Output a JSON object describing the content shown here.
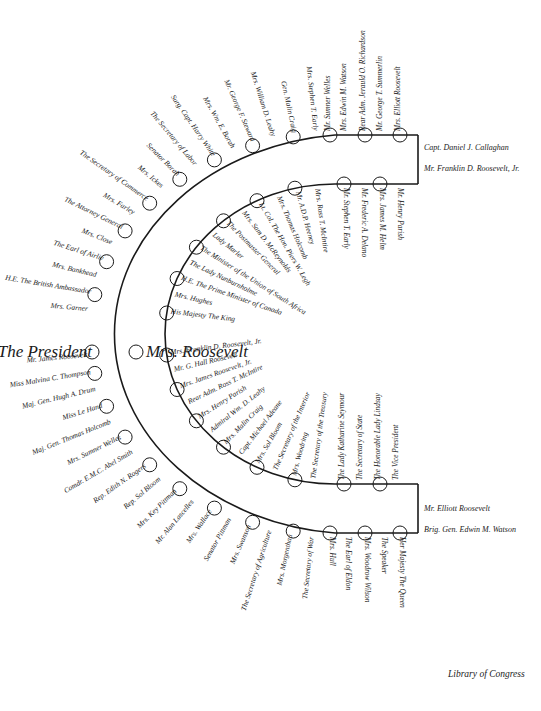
{
  "credit": "Library of Congress",
  "outer_top_leg": [
    "Mrs. Elliott Roosevelt",
    "Mr. George T. Summerlin",
    "Rear Adm. Jerauld O. Richardson",
    "Mrs. Edwin M. Watson",
    "Mr. Sumner Welles",
    "Mrs. Stephen T. Early",
    "Gen. Malin Craig",
    "Mrs. William D. Leahy",
    "Mr. George F. Steward",
    "Mrs. Wm. E. Borah",
    "Surg. Capt. Harry White",
    "The Secretary of Labor",
    "Senator Borah",
    "Mrs. Ickes",
    "The Secretary of Commerce",
    "Mrs. Farley",
    "The Attorney General",
    "Mrs. Close",
    "The Earl of Airlie",
    "Mrs. Bankhead",
    "H.E. The British Ambassador",
    "Mrs. Garner"
  ],
  "outer_center": {
    "left": "The President",
    "right": "Mrs. Roosevelt"
  },
  "outer_bottom_leg": [
    "Her Majesty The Queen",
    "The Speaker",
    "Mrs. Woodrow Wilson",
    "The Earl of Eldon",
    "Mrs. Hull",
    "The Secretary of War",
    "Mrs. Morgenthau",
    "The Secretary of Agriculture",
    "Mrs. Swanson",
    "Senator Pittman",
    "Mrs. Wallace",
    "Mr. Alan Lascelles",
    "Mrs. Key Pittman",
    "Rep. Sol Bloom",
    "Rep. Edith N. Rogers",
    "Comdr. E.M.C. Abel Smith",
    "Mrs. Sumner Welles",
    "Maj. Gen. Thomas Holcomb",
    "Miss Le Hand",
    "Maj. Gen. Hugh A. Drum",
    "Miss Malvina C. Thompson",
    "Mr. James Roosevelt"
  ],
  "inner_top_leg": [
    "Mr. Henry Parish",
    "Mrs. James M. Helm",
    "Mr. Frederic A. Delano",
    "Mr. Stephen T. Early",
    "Mrs. Ross T. McIntire",
    "Mr. A.D.P. Heeney",
    "Mrs. Thomas Holcomb",
    "Lt. Col. The Hon. Piers W. Legh",
    "Mrs. Sam D. McReynolds",
    "The Postmaster General",
    "Lady Marler",
    "The Minister of the Union of South Africa",
    "The Lady Nunburnholme",
    "H.E. The Prime Minister of Canada",
    "Mrs. Hughes",
    "His Majesty The King"
  ],
  "inner_bottom_leg": [
    "The Vice President",
    "The Honorable Lady Lindsay",
    "The Secretary of State",
    "The Lady Katharine Seymour",
    "The Secretary of the Treasury",
    "Mrs. Woodring",
    "The Secretary of the Interior",
    "Mrs. Sol Bloom",
    "Capt. Michael Adeane",
    "Mrs. Malin Craig",
    "Admiral Wm. D. Leahy",
    "Mrs. Henry Parish",
    "Rear Adm. Ross T. McIntire",
    "Mrs. James Roosevelt, Jr.",
    "Mr. G. Hall Roosevelt",
    "Mrs. Franklin D. Roosevelt, Jr."
  ],
  "end_top": [
    "Capt. Daniel J. Callaghan",
    "Mr. Franklin D. Roosevelt, Jr."
  ],
  "end_bottom": [
    "Mr. Elliott Roosevelt",
    "Brig. Gen. Edwin M. Watson"
  ]
}
